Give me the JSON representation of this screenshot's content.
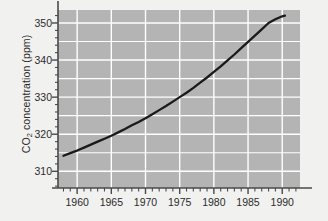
{
  "chart_data": {
    "type": "line",
    "title": "",
    "xlabel": "",
    "ylabel": "CO2 concentration (ppm)",
    "ylabel_prefix": "CO",
    "ylabel_sub": "2",
    "ylabel_suffix": " concentration (ppm)",
    "xlim": [
      1957.2,
      1992.6
    ],
    "ylim": [
      305.5,
      353.5
    ],
    "grid": true,
    "legend": null,
    "y_ticks": [
      310,
      320,
      330,
      340,
      350
    ],
    "y_tick_labels": [
      "310",
      "320",
      "330",
      "340",
      "350"
    ],
    "y_minor_step": 2,
    "x_ticks": [
      1960,
      1965,
      1970,
      1975,
      1980,
      1985,
      1990
    ],
    "x_tick_labels": [
      "1960",
      "1965",
      "1970",
      "1975",
      "1980",
      "1985",
      "1990"
    ],
    "x_minor_step": 1,
    "series": [
      {
        "name": "Mauna Loa CO2 trend",
        "color": "#1a1a1a",
        "line_width": 2.3,
        "x": [
          1958,
          1959,
          1960,
          1961,
          1962,
          1963,
          1964,
          1965,
          1966,
          1967,
          1968,
          1969,
          1970,
          1971,
          1972,
          1973,
          1974,
          1975,
          1976,
          1977,
          1978,
          1979,
          1980,
          1981,
          1982,
          1983,
          1984,
          1985,
          1986,
          1987,
          1988,
          1989,
          1990,
          1990.4
        ],
        "values": [
          314.2,
          314.9,
          315.6,
          316.4,
          317.2,
          318.0,
          318.8,
          319.6,
          320.5,
          321.4,
          322.4,
          323.3,
          324.3,
          325.4,
          326.5,
          327.6,
          328.8,
          330.0,
          331.2,
          332.5,
          333.9,
          335.3,
          336.8,
          338.3,
          339.9,
          341.5,
          343.2,
          344.9,
          346.6,
          348.3,
          350.0,
          351.0,
          351.8,
          352.0
        ]
      }
    ],
    "plot_bg": "#b4b4b4",
    "grid_color": "#ffffff",
    "axis_color": "#4a4a4a",
    "figure_bg": "#f1f1ef"
  }
}
